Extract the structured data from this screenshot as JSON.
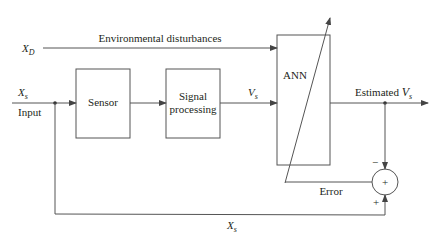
{
  "diagram": {
    "inputs": {
      "xd_label": "X",
      "xd_sub": "D",
      "disturbance_label": "Environmental disturbances",
      "xs_label": "X",
      "xs_sub": "s",
      "input_label": "Input"
    },
    "blocks": {
      "sensor": "Sensor",
      "signal_line1": "Signal",
      "signal_line2": "processing",
      "ann": "ANN"
    },
    "signals": {
      "vs_label": "V",
      "vs_sub": "s",
      "estimated_label": "Estimated ",
      "estimated_var": "V",
      "estimated_sub": "s",
      "error_label": "Error",
      "feedback_label": "X",
      "feedback_sub": "s"
    },
    "summing_junction": {
      "symbol": "+",
      "minus_sign": "−",
      "plus_sign": "+"
    }
  }
}
